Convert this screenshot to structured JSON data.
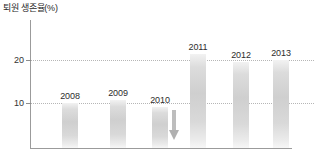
{
  "chart_data": {
    "type": "bar",
    "title": "퇴원 생존율(%)",
    "xlabel": "",
    "ylabel": "퇴원 생존율(%)",
    "categories": [
      "2008",
      "2009",
      "2010",
      "2011",
      "2012",
      "2013"
    ],
    "values": [
      10.0,
      10.7,
      9.0,
      21.5,
      19.5,
      20.0
    ],
    "value_labels": [
      "2008",
      "2009",
      "2010",
      "2011",
      "2012",
      "2013"
    ],
    "ylim": [
      0,
      24
    ],
    "yticks": [
      10,
      20
    ],
    "ytick_labels": [
      "10",
      "20"
    ],
    "grid": "horizontal-dotted",
    "legend": "none",
    "bar_color": "#d4d4d4",
    "grid_color": "#b6b6b6",
    "axis_color": "#9b9b9b",
    "annotations": [
      {
        "name": "down-arrow",
        "symbol": "↓",
        "color": "#b0b0b0",
        "between": [
          "2010",
          "2011"
        ]
      }
    ]
  },
  "axis": {
    "title": "퇴원 생존율(%)",
    "ticks": [
      {
        "label": "20",
        "value": 20
      },
      {
        "label": "10",
        "value": 10
      }
    ]
  },
  "bars": [
    {
      "label": "2008",
      "value": 10.0
    },
    {
      "label": "2009",
      "value": 10.7
    },
    {
      "label": "2010",
      "value": 9.0
    },
    {
      "label": "2011",
      "value": 21.5
    },
    {
      "label": "2012",
      "value": 19.5
    },
    {
      "label": "2013",
      "value": 20.0
    }
  ]
}
